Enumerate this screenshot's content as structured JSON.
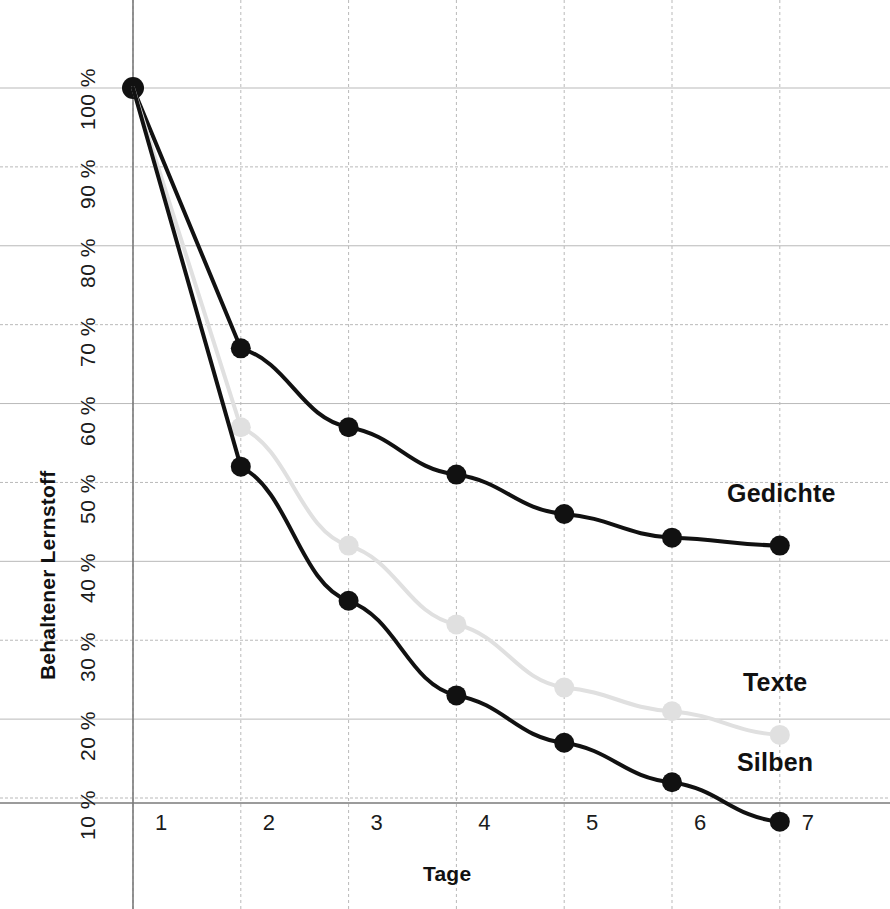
{
  "chart_data": {
    "type": "line",
    "title": "",
    "xlabel": "Tage",
    "ylabel": "Behaltener Lernstoff",
    "x": [
      1,
      2,
      3,
      4,
      5,
      6,
      7
    ],
    "categories": [
      "1",
      "2",
      "3",
      "4",
      "5",
      "6",
      "7"
    ],
    "xlim": [
      1,
      7
    ],
    "ylim": [
      5,
      100
    ],
    "grid": true,
    "legend_position": "right-inline",
    "y_ticks": [
      100,
      90,
      80,
      70,
      60,
      50,
      40,
      30,
      20,
      10
    ],
    "y_tick_labels": [
      "100 %",
      "90 %",
      "80 %",
      "70 %",
      "60 %",
      "50 %",
      "40 %",
      "30 %",
      "20 %",
      "10 %"
    ],
    "series": [
      {
        "name": "Gedichte",
        "color": "#111111",
        "marker_color": "#111111",
        "values": [
          100,
          67,
          57,
          51,
          46,
          43,
          42
        ]
      },
      {
        "name": "Texte",
        "color": "#e0e0e0",
        "marker_color": "#e0e0e0",
        "values": [
          100,
          57,
          42,
          32,
          24,
          21,
          18
        ]
      },
      {
        "name": "Silben",
        "color": "#111111",
        "marker_color": "#111111",
        "values": [
          100,
          52,
          35,
          23,
          17,
          12,
          7
        ]
      }
    ],
    "annotations": [
      {
        "text": "Gedichte",
        "series": "Gedichte",
        "at_x": 7
      },
      {
        "text": "Texte",
        "series": "Texte",
        "at_x": 7
      },
      {
        "text": "Silben",
        "series": "Silben",
        "at_x": 7
      }
    ],
    "colors": {
      "axis": "#7a7a7a",
      "grid": "#b9b9b9",
      "text": "#1b1b1b",
      "dark_series": "#111111",
      "light_series": "#e0e0e0",
      "background": "#ffffff"
    }
  },
  "axes": {
    "y_title": "Behaltener Lernstoff",
    "x_title": "Tage",
    "y_labels": [
      "100 %",
      "90 %",
      "80 %",
      "70 %",
      "60 %",
      "50 %",
      "40 %",
      "30 %",
      "20 %",
      "10 %"
    ],
    "x_labels": [
      "1",
      "2",
      "3",
      "4",
      "5",
      "6",
      "7"
    ]
  },
  "series_labels": {
    "gedichte": "Gedichte",
    "texte": "Texte",
    "silben": "Silben"
  }
}
